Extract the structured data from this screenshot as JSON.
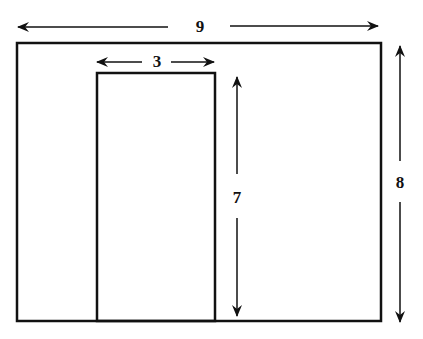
{
  "diagram": {
    "type": "dimensioned-rectangle-with-door",
    "outer_rectangle": {
      "width_label": "9",
      "height_label": "8"
    },
    "inner_rectangle": {
      "width_label": "3",
      "height_label": "7"
    },
    "colors": {
      "stroke": "#111111",
      "background": "#ffffff"
    }
  }
}
